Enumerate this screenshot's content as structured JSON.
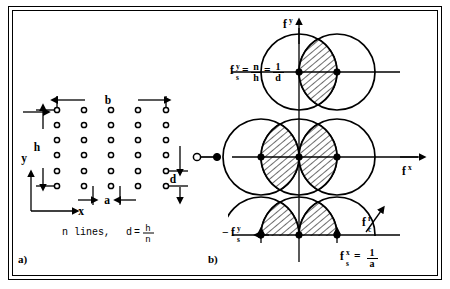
{
  "figure": {
    "panels": [
      {
        "id": "a",
        "label": "a)",
        "caption": "Spatial line/dot grid"
      },
      {
        "id": "b",
        "label": "b)",
        "caption": "Frequency domain circles"
      }
    ]
  },
  "panel_a": {
    "label": "a)",
    "dim_b": "b",
    "dim_h": "h",
    "dim_a": "a",
    "dim_d": "d",
    "axis_x": "x",
    "axis_y": "y",
    "note_text": "n lines,",
    "note_formula_lhs": "d",
    "note_formula_eq": "=",
    "note_formula_num": "h",
    "note_formula_den": "n",
    "grid_cols": 5,
    "grid_rows": 6
  },
  "panel_b": {
    "label": "b)",
    "axis_fy": "f",
    "axis_fy_sup": "y",
    "axis_fx": "f",
    "axis_fx_sup": "x",
    "fsy_f": "f",
    "fsy_sup": "y",
    "fsy_sub": "s",
    "fsy_eq1": "=",
    "fsy_num1": "n",
    "fsy_den1": "h",
    "fsy_eq2": "=",
    "fsy_num2": "1",
    "fsy_den2": "d",
    "neg_fsy_minus": "−",
    "neg_fsy_f": "f",
    "neg_fsy_sup": "y",
    "neg_fsy_sub": "s",
    "fsx_f": "f",
    "fsx_sup": "x",
    "fsx_sub": "s",
    "fsx_eq": "=",
    "fsx_num": "1",
    "fsx_den": "a",
    "fc_f": "f",
    "fc_sup": "r",
    "fc_sub": "c"
  },
  "colors": {
    "stroke": "#000000",
    "background": "#ffffff",
    "hatch": "#000000"
  }
}
